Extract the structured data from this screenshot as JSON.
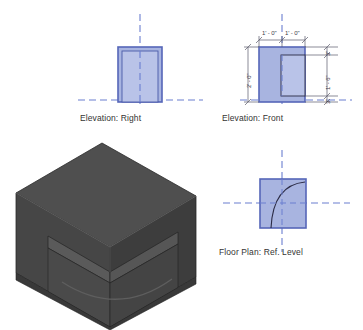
{
  "sheet": {
    "title": "Multi-view architectural drawing sheet",
    "background": "#ffffff",
    "width": 363,
    "height": 330
  },
  "colors": {
    "fill_blue": "#a8b4e0",
    "fill_blue_light": "#b9c3e8",
    "edge_blue": "#5566b8",
    "inner_line_blue": "#4a5aa8",
    "centerline_blue": "#6b7fd0",
    "dimension_line": "#5a5a6a",
    "text": "#333333",
    "cube_top": "#4f4f4f",
    "cube_left": "#464646",
    "cube_right": "#3d3d3d",
    "cube_interior_floor": "#5d5d5d",
    "cube_interior_back": "#505050",
    "cube_interior_side": "#3a3a3a",
    "cube_edge": "#2a2a2a",
    "arc_line": "#2b2b45"
  },
  "views": [
    {
      "id": "elevation-right",
      "label": "Elevation: Right",
      "type": "elevation",
      "has_inner_rect": true,
      "has_arc": false,
      "dimensions": []
    },
    {
      "id": "elevation-front",
      "label": "Elevation: Front",
      "type": "elevation",
      "has_inner_rect": true,
      "has_arc": false,
      "dimensions": [
        {
          "id": "width-left",
          "value": "1' - 0\"",
          "orientation": "horizontal"
        },
        {
          "id": "width-right",
          "value": "1' - 0\"",
          "orientation": "horizontal"
        },
        {
          "id": "height-overall",
          "value": "2' - 0\"",
          "orientation": "vertical"
        },
        {
          "id": "offset-top",
          "value": "3\"",
          "orientation": "vertical"
        },
        {
          "id": "opening-height",
          "value": "1' - 6\"",
          "orientation": "vertical"
        },
        {
          "id": "offset-bottom",
          "value": "3\"",
          "orientation": "vertical"
        }
      ]
    },
    {
      "id": "floor-plan",
      "label": "Floor Plan: Ref. Level",
      "type": "plan",
      "has_inner_rect": false,
      "has_arc": true,
      "dimensions": []
    },
    {
      "id": "three-d",
      "label": "",
      "type": "isometric",
      "has_inner_rect": false,
      "has_arc": false,
      "dimensions": []
    }
  ]
}
